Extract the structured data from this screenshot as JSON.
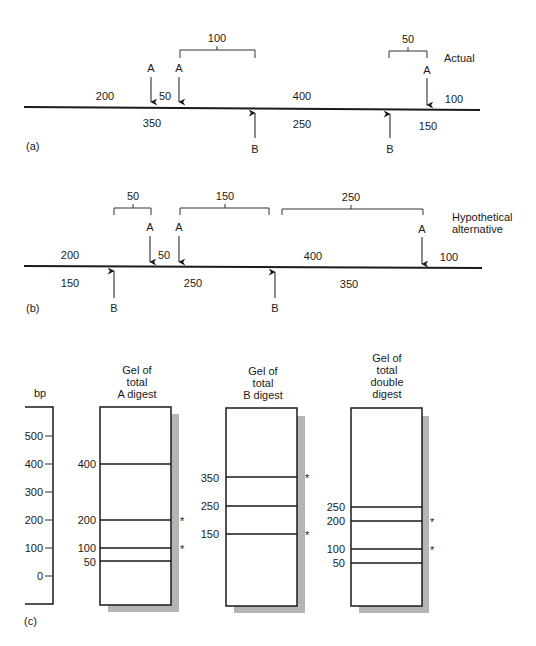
{
  "panel_a": {
    "tag": "(a)",
    "title": "Actual",
    "site_label_a": "A",
    "site_label_b": "B",
    "fragments_above": [
      "200",
      "50",
      "400",
      "100"
    ],
    "fragments_below": [
      "350",
      "250",
      "150"
    ],
    "brackets": [
      "100",
      "50"
    ]
  },
  "panel_b": {
    "tag": "(b)",
    "title_line1": "Hypothetical",
    "title_line2": "alternative",
    "site_label_a": "A",
    "site_label_b": "B",
    "fragments_above": [
      "200",
      "50",
      "400",
      "100"
    ],
    "fragments_below": [
      "150",
      "250",
      "350"
    ],
    "brackets": [
      "50",
      "150",
      "250"
    ]
  },
  "panel_c": {
    "tag": "(c)",
    "scale": {
      "unit": "bp",
      "ticks": [
        "500",
        "400",
        "300",
        "200",
        "100",
        "0"
      ]
    },
    "gels": [
      {
        "title": [
          "Gel of",
          "total",
          "A digest"
        ],
        "bands": [
          "400",
          "200",
          "100",
          "50"
        ],
        "starred": [
          "200",
          "100"
        ]
      },
      {
        "title": [
          "Gel of",
          "total",
          "B digest"
        ],
        "bands": [
          "350",
          "250",
          "150"
        ],
        "starred": [
          "350",
          "150"
        ]
      },
      {
        "title": [
          "Gel of",
          "total",
          "double",
          "digest"
        ],
        "bands": [
          "250",
          "200",
          "100",
          "50"
        ],
        "starred": [
          "200",
          "100"
        ]
      }
    ],
    "star_symbol": "*"
  }
}
